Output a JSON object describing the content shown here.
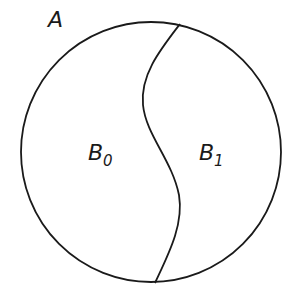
{
  "diagram": {
    "set_label": "A",
    "regions": [
      {
        "name": "B",
        "subscript": "0"
      },
      {
        "name": "B",
        "subscript": "1"
      }
    ],
    "stroke_color": "#1a1a1a",
    "background": "#ffffff"
  }
}
